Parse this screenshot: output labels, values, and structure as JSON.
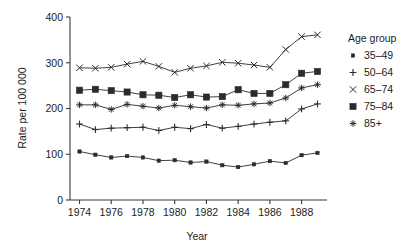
{
  "chart_data": {
    "type": "line",
    "title": "",
    "xlabel": "Year",
    "ylabel": "Rate per 100 000",
    "xlim": [
      1973.4,
      1989.6
    ],
    "ylim": [
      0,
      400
    ],
    "yticks": [
      0,
      100,
      200,
      300,
      400
    ],
    "xticks": [
      1974,
      1976,
      1978,
      1980,
      1982,
      1984,
      1986,
      1988
    ],
    "xtick_labels": [
      "1974",
      "1976",
      "1978",
      "1980",
      "1982",
      "1984",
      "1986",
      "1988"
    ],
    "ytick_labels": [
      "0",
      "100",
      "200",
      "300",
      "400"
    ],
    "grid": false,
    "legend_position": "right",
    "legend_title": "Age group",
    "x": [
      1974,
      1975,
      1976,
      1977,
      1978,
      1979,
      1980,
      1981,
      1982,
      1983,
      1984,
      1985,
      1986,
      1987,
      1988,
      1989
    ],
    "series": [
      {
        "name": "35–49",
        "marker": "filled-square-small",
        "values": [
          106,
          99,
          93,
          96,
          93,
          86,
          87,
          82,
          84,
          76,
          72,
          78,
          85,
          81,
          98,
          103
        ]
      },
      {
        "name": "50–64",
        "marker": "plus",
        "values": [
          166,
          154,
          157,
          158,
          159,
          152,
          159,
          156,
          165,
          157,
          161,
          166,
          170,
          173,
          199,
          210
        ]
      },
      {
        "name": "65–74",
        "marker": "asterisk",
        "values": [
          289,
          288,
          290,
          297,
          303,
          292,
          279,
          288,
          293,
          301,
          299,
          295,
          290,
          329,
          357,
          361
        ]
      },
      {
        "name": "75–84",
        "marker": "filled-square",
        "values": [
          240,
          242,
          239,
          236,
          230,
          229,
          224,
          230,
          225,
          226,
          241,
          233,
          233,
          252,
          277,
          281
        ]
      },
      {
        "name": "85+",
        "marker": "star",
        "values": [
          208,
          208,
          198,
          209,
          205,
          201,
          207,
          204,
          201,
          208,
          207,
          210,
          212,
          223,
          245,
          252
        ]
      }
    ]
  },
  "legend": {
    "title": "Age group",
    "items": [
      {
        "label": "35–49",
        "marker": "filled-square-small"
      },
      {
        "label": "50–64",
        "marker": "plus"
      },
      {
        "label": "65–74",
        "marker": "asterisk"
      },
      {
        "label": "75–84",
        "marker": "filled-square"
      },
      {
        "label": "85+",
        "marker": "star"
      }
    ]
  },
  "axes": {
    "y_title": "Rate per 100 000",
    "x_title": "Year"
  }
}
